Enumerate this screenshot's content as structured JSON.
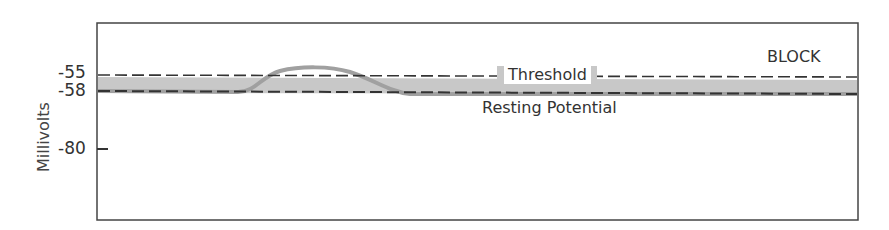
{
  "diagram": {
    "ylabel": "Millivolts",
    "ticks": [
      {
        "label": "-55",
        "value": -55
      },
      {
        "label": "-58",
        "value": -58
      },
      {
        "label": "-80",
        "value": -80
      }
    ],
    "block_label": "BLOCK",
    "threshold_label": "Threshold",
    "resting_label": "Resting Potential",
    "colors": {
      "band": "#c8c8c8",
      "curve": "#a0a0a0",
      "dash": "#333333",
      "frame": "#444444"
    }
  }
}
